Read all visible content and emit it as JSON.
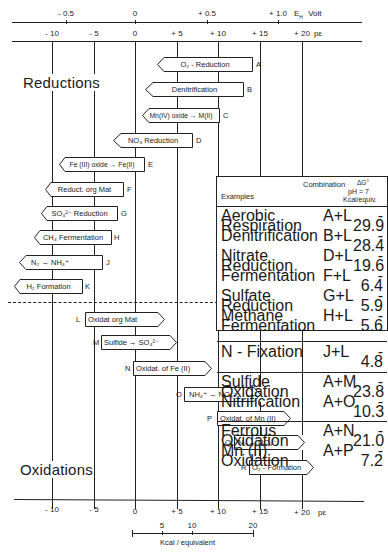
{
  "axes": {
    "eh_axis": {
      "unit_label": "E",
      "unit_sub": "H",
      "unit_suffix": "Volt",
      "ticks": [
        {
          "label": "- 0.5",
          "x": 66
        },
        {
          "label": "0",
          "x": 135
        },
        {
          "label": "+ 0.5",
          "x": 207
        },
        {
          "label": "+ 1.0",
          "x": 278
        }
      ]
    },
    "pe_axis_top": {
      "unit_label": "pε",
      "ticks": [
        {
          "label": "- 10",
          "x": 52
        },
        {
          "label": "- 5",
          "x": 94
        },
        {
          "label": "0",
          "x": 135
        },
        {
          "label": "+ 5",
          "x": 177
        },
        {
          "label": "+ 10",
          "x": 218
        },
        {
          "label": "+ 15",
          "x": 260
        },
        {
          "label": "+ 20",
          "x": 302
        }
      ]
    },
    "pe_axis_bottom": {
      "unit_label": "pε",
      "ticks": [
        {
          "label": "- 10",
          "x": 52
        },
        {
          "label": "- 5",
          "x": 94
        },
        {
          "label": "0",
          "x": 135
        },
        {
          "label": "+ 5",
          "x": 177
        },
        {
          "label": "+ 10",
          "x": 218
        },
        {
          "label": "+ 15",
          "x": 260
        },
        {
          "label": "+ 20",
          "x": 302
        }
      ]
    },
    "kcal_scale": {
      "label": "Kcal / equivalent",
      "ticks": [
        {
          "label": "5",
          "x": 162
        },
        {
          "label": "10",
          "x": 192
        },
        {
          "label": "20",
          "x": 252
        }
      ]
    }
  },
  "sections": {
    "reductions_title": "Reductions",
    "oxidations_title": "Oxidations"
  },
  "reductions": [
    {
      "id": "A",
      "label": "O₂ - Reduction",
      "pe": 13.8
    },
    {
      "id": "B",
      "label": "Denitrification",
      "pe": 12.6
    },
    {
      "id": "C",
      "label": "Mn(IV) oxide → M(II)",
      "pe": 8.9
    },
    {
      "id": "D",
      "label": "NO₃ Reduction",
      "pe": 6.15
    },
    {
      "id": "E",
      "label": "Fe (III) oxide → Fe(II)",
      "pe": -0.8
    },
    {
      "id": "F",
      "label": "Reduct. org Mat",
      "pe": -3.0
    },
    {
      "id": "G",
      "label": "SO₄²⁻ Reduction",
      "pe": -3.5
    },
    {
      "id": "H",
      "label": "CH₄ Fermentation",
      "pe": -4.1
    },
    {
      "id": "J",
      "label": "N₂ → NH₄⁺",
      "pe": -4.7
    },
    {
      "id": "K",
      "label": "H₂ Formation",
      "pe": -7.1
    }
  ],
  "oxidations": [
    {
      "id": "L",
      "label": "Oxidat org Mat",
      "pe": -8.6
    },
    {
      "id": "M",
      "label": "Sulfide → SO₄²⁻",
      "pe": -3.6
    },
    {
      "id": "N",
      "label": "Oxidat. of Fe (II)",
      "pe": 0.0
    },
    {
      "id": "O",
      "label": "NH₄⁺ → NO₃⁻",
      "pe": 6.0
    },
    {
      "id": "P",
      "label": "Oxidat. of Mn (II)",
      "pe": 8.7
    },
    {
      "id": "Q",
      "label": "N₂ → NO₃⁻",
      "pe": 12.4
    },
    {
      "id": "R",
      "label": "O₂ - Formation",
      "pe": 13.8
    }
  ],
  "examples_table": {
    "header_examples": "Examples",
    "header_combination": "Combination",
    "header_dg": "ΔG°",
    "header_ph": "pH = 7",
    "header_unit": "Kcal/equiv.",
    "groups": [
      [
        {
          "name": "Aerobic Respiration",
          "combo": "A+L",
          "value": "- 29.9"
        },
        {
          "name": "Denitrification",
          "combo": "B+L",
          "value": "- 28.4"
        },
        {
          "name": "Nitrate Reduction",
          "combo": "D+L",
          "value": "- 19.6"
        },
        {
          "name": "Fermentation",
          "combo": "F+L",
          "value": "- 6.4"
        },
        {
          "name": "Sulfate Reduction",
          "combo": "G+L",
          "value": "- 5.9"
        },
        {
          "name": "Methane Fermentation",
          "combo": "H+L",
          "value": "- 5.6"
        }
      ],
      [
        {
          "name": "N - Fixation",
          "combo": "J+L",
          "value": "- 4.8"
        }
      ],
      [
        {
          "name": "Sulfide Oxidation",
          "combo": "A+M",
          "value": "- 23.8"
        },
        {
          "name": "Nitrification",
          "combo": "A+O",
          "value": "- 10.3"
        }
      ],
      [
        {
          "name": "Ferrous Oxidation",
          "combo": "A+N",
          "value": "- 21.0"
        },
        {
          "name": "Mn (II) Oxidation",
          "combo": "A+P",
          "value": "- 7.2"
        }
      ]
    ]
  }
}
